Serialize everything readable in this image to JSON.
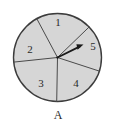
{
  "figure": {
    "caption": "A",
    "background_color": "#ffffff"
  },
  "spinner": {
    "name": "five-sector-spinner",
    "center": {
      "x": 57.5,
      "y": 57.5
    },
    "radius": 44,
    "fill_color": "#d6d6d6",
    "stroke_color": "#3c3c3c",
    "stroke_width": 1.4,
    "spoke_color": "#4a4a4a",
    "spoke_width": 1.0,
    "label_color": "#2a2a2a",
    "sectors": [
      {
        "label": "1",
        "start_angle": -118,
        "end_angle": -44,
        "label_x": 58,
        "label_y": 23
      },
      {
        "label": "2",
        "start_angle": -186,
        "end_angle": -118,
        "label_x": 30,
        "label_y": 50
      },
      {
        "label": "3",
        "start_angle": 91,
        "end_angle": 174,
        "label_x": 41,
        "label_y": 84
      },
      {
        "label": "4",
        "start_angle": 18,
        "end_angle": 91,
        "label_x": 76,
        "label_y": 84
      },
      {
        "label": "5",
        "start_angle": -44,
        "end_angle": 18,
        "label_x": 93,
        "label_y": 47
      }
    ]
  },
  "pointer": {
    "name": "spinner-arrow",
    "from_x": 57.5,
    "from_y": 57.5,
    "to_x": 83,
    "to_y": 45,
    "color": "#1a1a1a",
    "width": 1.8,
    "selected_sector": "5"
  }
}
